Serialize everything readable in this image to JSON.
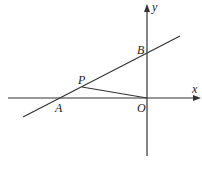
{
  "diagram": {
    "type": "coordinate-geometry",
    "axes": {
      "x_label": "x",
      "y_label": "y",
      "origin_label": "O"
    },
    "points": [
      {
        "label": "A",
        "desc": "intersection of line with x-axis"
      },
      {
        "label": "B",
        "desc": "intersection of line with y-axis"
      },
      {
        "label": "P",
        "desc": "point on line AB, connected to O"
      },
      {
        "label": "O",
        "desc": "origin"
      }
    ],
    "segments": [
      "line AB (extended)",
      "PO"
    ],
    "colors": {
      "stroke": "#333333",
      "background": "#ffffff"
    }
  }
}
